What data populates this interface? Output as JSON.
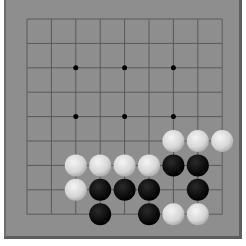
{
  "board": {
    "size": 9,
    "origin_x": 27,
    "origin_y": 19,
    "spacing": 24.4,
    "background_color": "#8e8e8e",
    "line_color": "#5a5a5a",
    "star_points": [
      [
        2,
        2
      ],
      [
        4,
        2
      ],
      [
        6,
        2
      ],
      [
        2,
        4
      ],
      [
        4,
        4
      ],
      [
        6,
        4
      ]
    ],
    "stones": [
      {
        "col": 6,
        "row": 5,
        "color": "white"
      },
      {
        "col": 7,
        "row": 5,
        "color": "white"
      },
      {
        "col": 8,
        "row": 5,
        "color": "white"
      },
      {
        "col": 2,
        "row": 6,
        "color": "white"
      },
      {
        "col": 3,
        "row": 6,
        "color": "white"
      },
      {
        "col": 4,
        "row": 6,
        "color": "white"
      },
      {
        "col": 5,
        "row": 6,
        "color": "white"
      },
      {
        "col": 6,
        "row": 6,
        "color": "black"
      },
      {
        "col": 7,
        "row": 6,
        "color": "black"
      },
      {
        "col": 2,
        "row": 7,
        "color": "white"
      },
      {
        "col": 3,
        "row": 7,
        "color": "black"
      },
      {
        "col": 4,
        "row": 7,
        "color": "black"
      },
      {
        "col": 5,
        "row": 7,
        "color": "black"
      },
      {
        "col": 7,
        "row": 7,
        "color": "black"
      },
      {
        "col": 3,
        "row": 8,
        "color": "black"
      },
      {
        "col": 5,
        "row": 8,
        "color": "black"
      },
      {
        "col": 6,
        "row": 8,
        "color": "white"
      },
      {
        "col": 7,
        "row": 8,
        "color": "white"
      }
    ]
  }
}
